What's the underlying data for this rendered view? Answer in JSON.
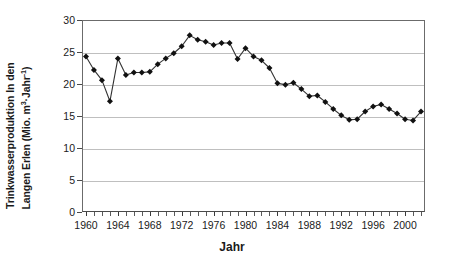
{
  "chart_data": {
    "type": "line",
    "title": "",
    "xlabel": "Jahr",
    "ylabel": "Trinkwasserproduktion In den Langen Erlen (Mio. m3·Jahr-1)",
    "ylabel_line_1": "Trinkwasserproduktion In den",
    "ylabel_line_2_pre": "Langen Erlen (Mio. m",
    "ylabel_line_2_sup1": "3",
    "ylabel_line_2_mid": "·Jahr",
    "ylabel_line_2_sup2": "-1",
    "ylabel_line_2_post": ")",
    "xlim": [
      1959.5,
      2002.5
    ],
    "ylim": [
      0,
      30
    ],
    "ytick_values": [
      0,
      5,
      10,
      15,
      20,
      25,
      30
    ],
    "ytick_labels": [
      "0",
      "5",
      "10",
      "15",
      "20",
      "25",
      "30"
    ],
    "xtick_labels": [
      "1960",
      "1964",
      "1968",
      "1972",
      "1976",
      "1980",
      "1984",
      "1988",
      "1992",
      "1996",
      "2000"
    ],
    "xtick_values": [
      1960,
      1964,
      1968,
      1972,
      1976,
      1980,
      1984,
      1988,
      1992,
      1996,
      2000
    ],
    "xtick_minor_step": 1,
    "grid": "horizontal",
    "grid_color": "#bfbfbf",
    "legend": "none",
    "marker": "diamond",
    "marker_color": "#111111",
    "line_color": "#333333",
    "x": [
      1960,
      1961,
      1962,
      1963,
      1964,
      1965,
      1966,
      1967,
      1968,
      1969,
      1970,
      1971,
      1972,
      1973,
      1974,
      1975,
      1976,
      1977,
      1978,
      1979,
      1980,
      1981,
      1982,
      1983,
      1984,
      1985,
      1986,
      1987,
      1988,
      1989,
      1990,
      1991,
      1992,
      1993,
      1994,
      1995,
      1996,
      1997,
      1998,
      1999,
      2000,
      2001,
      2002
    ],
    "values": [
      24.3,
      22.2,
      20.6,
      17.3,
      24.0,
      21.4,
      21.8,
      21.8,
      21.9,
      23.1,
      24.0,
      24.8,
      25.9,
      27.6,
      26.9,
      26.6,
      26.1,
      26.4,
      26.4,
      23.9,
      25.6,
      24.3,
      23.7,
      22.5,
      20.1,
      19.9,
      20.2,
      19.2,
      18.1,
      18.2,
      17.2,
      16.1,
      15.1,
      14.4,
      14.5,
      15.7,
      16.5,
      16.8,
      16.1,
      15.4,
      14.5,
      14.3,
      15.7
    ],
    "series_name": "Trinkwasserproduktion"
  }
}
